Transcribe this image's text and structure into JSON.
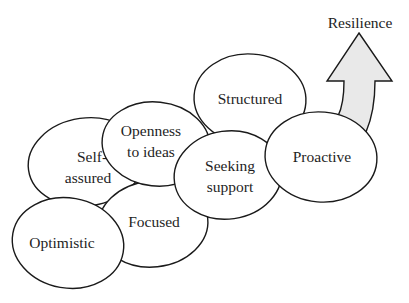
{
  "diagram": {
    "type": "overlapping-ellipses-progression",
    "outcome": {
      "label": "Resilience",
      "icon": "up-arrow-icon",
      "arrow_fill": "#e9e9e9"
    },
    "nodes": [
      {
        "id": "self-assured",
        "lines": [
          "Self-",
          "assured"
        ]
      },
      {
        "id": "focused",
        "lines": [
          "Focused"
        ]
      },
      {
        "id": "optimistic",
        "lines": [
          "Optimistic"
        ]
      },
      {
        "id": "structured",
        "lines": [
          "Structured"
        ]
      },
      {
        "id": "openness",
        "lines": [
          "Openness",
          "to ideas"
        ]
      },
      {
        "id": "seeking-support",
        "lines": [
          "Seeking",
          "support"
        ]
      },
      {
        "id": "proactive",
        "lines": [
          "Proactive"
        ]
      }
    ],
    "colors": {
      "stroke": "#1a1a1a",
      "ellipse_fill": "#ffffff",
      "text": "#1e1e1e",
      "background": "#ffffff"
    }
  }
}
